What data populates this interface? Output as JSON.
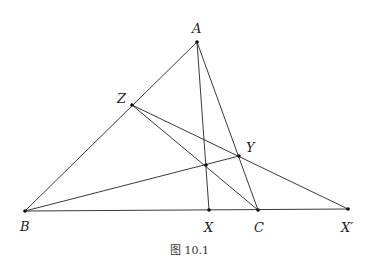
{
  "figure": {
    "caption": "图 10.1",
    "points": {
      "A": {
        "label": "A",
        "x": 197,
        "y": 42
      },
      "Z": {
        "label": "Z",
        "x": 132,
        "y": 105
      },
      "Y": {
        "label": "Y",
        "x": 239,
        "y": 156
      },
      "P": {
        "label": "",
        "x": 206,
        "y": 165
      },
      "B": {
        "label": "B",
        "x": 25,
        "y": 211
      },
      "X": {
        "label": "X",
        "x": 209,
        "y": 210
      },
      "C": {
        "label": "C",
        "x": 258,
        "y": 210
      },
      "Xp": {
        "label": "X′",
        "x": 348,
        "y": 209
      }
    },
    "segments": [
      [
        "A",
        "B"
      ],
      [
        "A",
        "C"
      ],
      [
        "A",
        "X"
      ],
      [
        "B",
        "Xp"
      ],
      [
        "Z",
        "C"
      ],
      [
        "Z",
        "Xp"
      ],
      [
        "B",
        "Y"
      ]
    ]
  }
}
